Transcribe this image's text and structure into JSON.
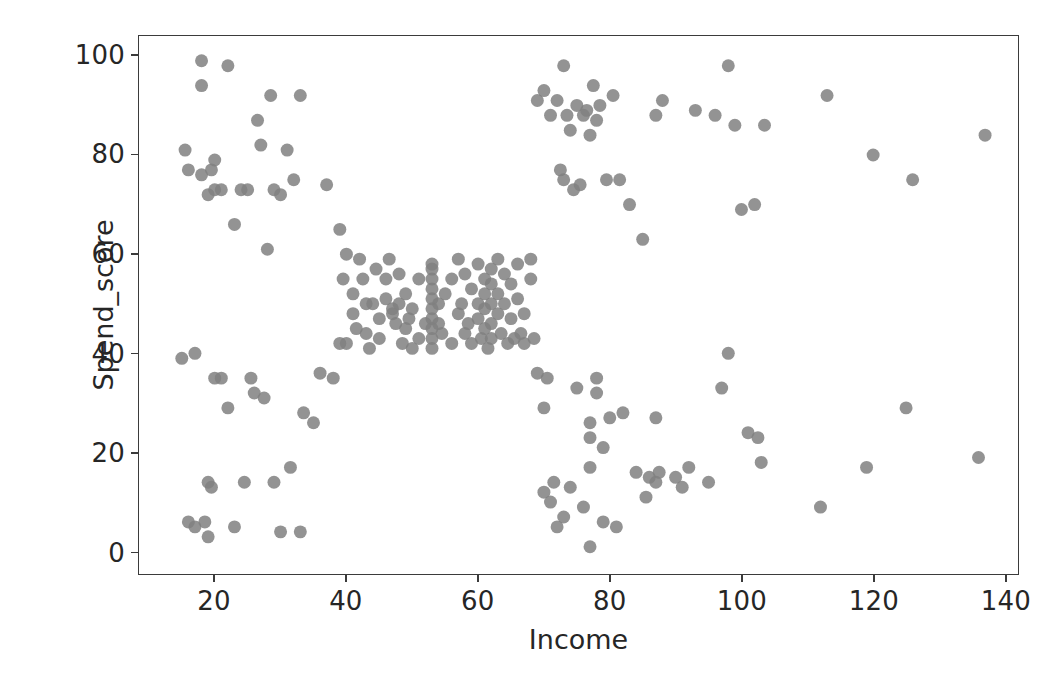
{
  "chart_data": {
    "type": "scatter",
    "title": "",
    "xlabel": "Income",
    "ylabel": "Spend_score",
    "xlim": [
      8.5,
      142
    ],
    "ylim": [
      -4.5,
      104
    ],
    "xticks": [
      20,
      40,
      60,
      80,
      100,
      120,
      140
    ],
    "yticks": [
      0,
      20,
      40,
      60,
      80,
      100
    ],
    "grid": false,
    "legend": null,
    "marker": {
      "shape": "circle",
      "color": "#808080",
      "size_px": 13,
      "alpha": 0.85,
      "edge": "none"
    },
    "n_points": 200,
    "points": [
      [
        15,
        39
      ],
      [
        15.5,
        81
      ],
      [
        16,
        6
      ],
      [
        16,
        77
      ],
      [
        17,
        40
      ],
      [
        17,
        5
      ],
      [
        18,
        94
      ],
      [
        18,
        99
      ],
      [
        18,
        76
      ],
      [
        18.5,
        6
      ],
      [
        19,
        3
      ],
      [
        19,
        72
      ],
      [
        19,
        14
      ],
      [
        19.5,
        77
      ],
      [
        19.5,
        13
      ],
      [
        20,
        35
      ],
      [
        20,
        73
      ],
      [
        20,
        79
      ],
      [
        21,
        35
      ],
      [
        21,
        73
      ],
      [
        22,
        29
      ],
      [
        22,
        98
      ],
      [
        23,
        5
      ],
      [
        23,
        66
      ],
      [
        24,
        73
      ],
      [
        24.5,
        14
      ],
      [
        25,
        73
      ],
      [
        25.5,
        35
      ],
      [
        26,
        32
      ],
      [
        26.5,
        87
      ],
      [
        27,
        82
      ],
      [
        27.5,
        31
      ],
      [
        28,
        61
      ],
      [
        28.5,
        92
      ],
      [
        29,
        14
      ],
      [
        29,
        73
      ],
      [
        30,
        4
      ],
      [
        30,
        72
      ],
      [
        31,
        81
      ],
      [
        31.5,
        17
      ],
      [
        32,
        75
      ],
      [
        33,
        4
      ],
      [
        33,
        92
      ],
      [
        33.5,
        28
      ],
      [
        35,
        26
      ],
      [
        36,
        36
      ],
      [
        37,
        74
      ],
      [
        38,
        35
      ],
      [
        39,
        42
      ],
      [
        39,
        65
      ],
      [
        39.5,
        55
      ],
      [
        40,
        60
      ],
      [
        40,
        42
      ],
      [
        41,
        48
      ],
      [
        41,
        52
      ],
      [
        41.5,
        45
      ],
      [
        42,
        59
      ],
      [
        42.5,
        55
      ],
      [
        43,
        50
      ],
      [
        43,
        44
      ],
      [
        43.5,
        41
      ],
      [
        44,
        50
      ],
      [
        44.5,
        57
      ],
      [
        45,
        47
      ],
      [
        45,
        43
      ],
      [
        46,
        55
      ],
      [
        46,
        51
      ],
      [
        46.5,
        59
      ],
      [
        47,
        48
      ],
      [
        47,
        49
      ],
      [
        47.5,
        46
      ],
      [
        48,
        50
      ],
      [
        48,
        56
      ],
      [
        48.5,
        42
      ],
      [
        49,
        52
      ],
      [
        49,
        45
      ],
      [
        49.5,
        47
      ],
      [
        50,
        49
      ],
      [
        50,
        41
      ],
      [
        51,
        55
      ],
      [
        51,
        43
      ],
      [
        52,
        46
      ],
      [
        53,
        41
      ],
      [
        53,
        43
      ],
      [
        53,
        45
      ],
      [
        53,
        47
      ],
      [
        53,
        49
      ],
      [
        53,
        51
      ],
      [
        53,
        53
      ],
      [
        53,
        55
      ],
      [
        53,
        57
      ],
      [
        53,
        58
      ],
      [
        54,
        46
      ],
      [
        54,
        50
      ],
      [
        54.5,
        44
      ],
      [
        55,
        52
      ],
      [
        56,
        42
      ],
      [
        56,
        55
      ],
      [
        57,
        48
      ],
      [
        57,
        59
      ],
      [
        57.5,
        50
      ],
      [
        58,
        44
      ],
      [
        58,
        56
      ],
      [
        58.5,
        46
      ],
      [
        59,
        53
      ],
      [
        59,
        42
      ],
      [
        60,
        58
      ],
      [
        60,
        50
      ],
      [
        60,
        47
      ],
      [
        60.5,
        43
      ],
      [
        61,
        55
      ],
      [
        61,
        52
      ],
      [
        61,
        49
      ],
      [
        61,
        45
      ],
      [
        61.5,
        41
      ],
      [
        62,
        57
      ],
      [
        62,
        54
      ],
      [
        62,
        50
      ],
      [
        62,
        46
      ],
      [
        62,
        43
      ],
      [
        63,
        59
      ],
      [
        63,
        52
      ],
      [
        63,
        48
      ],
      [
        63.5,
        44
      ],
      [
        64,
        56
      ],
      [
        64,
        50
      ],
      [
        64.5,
        42
      ],
      [
        65,
        54
      ],
      [
        65,
        47
      ],
      [
        65.5,
        43
      ],
      [
        66,
        58
      ],
      [
        66,
        51
      ],
      [
        66.5,
        44
      ],
      [
        67,
        48
      ],
      [
        67,
        42
      ],
      [
        68,
        59
      ],
      [
        68,
        55
      ],
      [
        68.5,
        43
      ],
      [
        69,
        36
      ],
      [
        69,
        91
      ],
      [
        70,
        12
      ],
      [
        70,
        29
      ],
      [
        70,
        93
      ],
      [
        70.5,
        35
      ],
      [
        71,
        10
      ],
      [
        71,
        88
      ],
      [
        71.5,
        14
      ],
      [
        72,
        5
      ],
      [
        72,
        91
      ],
      [
        72.5,
        77
      ],
      [
        73,
        7
      ],
      [
        73,
        75
      ],
      [
        73,
        98
      ],
      [
        73.5,
        88
      ],
      [
        74,
        13
      ],
      [
        74,
        85
      ],
      [
        74.5,
        73
      ],
      [
        75,
        90
      ],
      [
        75,
        33
      ],
      [
        75.5,
        74
      ],
      [
        76,
        9
      ],
      [
        76,
        88
      ],
      [
        76.5,
        89
      ],
      [
        77,
        1
      ],
      [
        77,
        17
      ],
      [
        77,
        23
      ],
      [
        77,
        26
      ],
      [
        77,
        84
      ],
      [
        77.5,
        94
      ],
      [
        78,
        32
      ],
      [
        78,
        35
      ],
      [
        78,
        87
      ],
      [
        78.5,
        90
      ],
      [
        79,
        6
      ],
      [
        79,
        21
      ],
      [
        79.5,
        75
      ],
      [
        80,
        27
      ],
      [
        80.5,
        92
      ],
      [
        81,
        5
      ],
      [
        81.5,
        75
      ],
      [
        82,
        28
      ],
      [
        83,
        70
      ],
      [
        84,
        16
      ],
      [
        85,
        63
      ],
      [
        85.5,
        11
      ],
      [
        86,
        15
      ],
      [
        87,
        14
      ],
      [
        87,
        27
      ],
      [
        87,
        88
      ],
      [
        87.5,
        16
      ],
      [
        88,
        91
      ],
      [
        90,
        15
      ],
      [
        91,
        13
      ],
      [
        92,
        17
      ],
      [
        93,
        89
      ],
      [
        95,
        14
      ],
      [
        96,
        88
      ],
      [
        97,
        33
      ],
      [
        98,
        40
      ],
      [
        98,
        98
      ],
      [
        99,
        86
      ],
      [
        100,
        69
      ],
      [
        101,
        24
      ],
      [
        102,
        70
      ],
      [
        102.5,
        23
      ],
      [
        103,
        18
      ],
      [
        103.5,
        86
      ],
      [
        112,
        9
      ],
      [
        113,
        92
      ],
      [
        119,
        17
      ],
      [
        120,
        80
      ],
      [
        125,
        29
      ],
      [
        126,
        75
      ],
      [
        136,
        19
      ],
      [
        137,
        84
      ]
    ]
  },
  "axis_labels": {
    "x": "Income",
    "y": "Spend_score"
  },
  "tick_text": {
    "x": [
      "20",
      "40",
      "60",
      "80",
      "100",
      "120",
      "140"
    ],
    "y": [
      "0",
      "20",
      "40",
      "60",
      "80",
      "100"
    ]
  }
}
